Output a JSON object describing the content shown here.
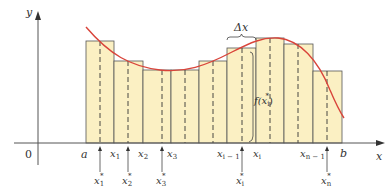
{
  "diagram": {
    "type": "riemann-sum",
    "colors": {
      "curve": "#d9443a",
      "rect_fill": "#fbf0c3",
      "rect_stroke": "#555555",
      "axis": "#555555",
      "text": "#333333"
    },
    "axes": {
      "x_label": "x",
      "y_label": "y",
      "origin_label": "0"
    },
    "partition_labels": {
      "a": "a",
      "b": "b",
      "x1": "x",
      "x1_sub": "1",
      "x2": "x",
      "x2_sub": "2",
      "x3": "x",
      "x3_sub": "3",
      "xim1": "x",
      "xim1_sub": "i − 1",
      "xi": "x",
      "xi_sub": "i",
      "xnm1": "x",
      "xnm1_sub": "n − 1"
    },
    "sample_labels": {
      "s1": "x",
      "s1_sub": "1",
      "s1_sup": "*",
      "s2": "x",
      "s2_sub": "2",
      "s2_sup": "*",
      "s3": "x",
      "s3_sub": "3",
      "s3_sup": "*",
      "si": "x",
      "si_sub": "i",
      "si_sup": "*",
      "sn": "x",
      "sn_sub": "n",
      "sn_sup": "*"
    },
    "annotations": {
      "delta_x": "Δx",
      "f_xi_star": "f(x",
      "f_xi_star_sub": "i",
      "f_xi_star_sup": "*",
      "f_close": ")"
    },
    "rectangles": [
      {
        "x0": 86,
        "x1": 114,
        "top": 41,
        "sample": 100
      },
      {
        "x0": 114,
        "x1": 143,
        "top": 61,
        "sample": 128
      },
      {
        "x0": 143,
        "x1": 171,
        "top": 70,
        "sample": 162
      },
      {
        "x0": 171,
        "x1": 199,
        "top": 70,
        "sample": 185
      },
      {
        "x0": 199,
        "x1": 227,
        "top": 61,
        "sample": 213
      },
      {
        "x0": 227,
        "x1": 256,
        "top": 48,
        "sample": 242
      },
      {
        "x0": 256,
        "x1": 284,
        "top": 38,
        "sample": 270
      },
      {
        "x0": 284,
        "x1": 313,
        "top": 44,
        "sample": 298
      },
      {
        "x0": 313,
        "x1": 342,
        "top": 71,
        "sample": 327
      }
    ]
  }
}
